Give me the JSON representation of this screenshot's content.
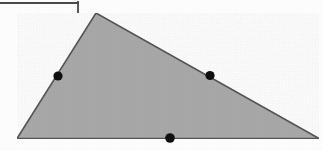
{
  "figure": {
    "caption": "",
    "type": "geometric-diagram",
    "shape_name": "triangle",
    "canvas": {
      "width": 323,
      "height": 150
    },
    "colors": {
      "background": "#fefefe",
      "triangle_fill": "#a8a8a8",
      "triangle_stroke": "#555555",
      "point_fill": "#101010",
      "artifact_stroke": "#4a4a4a"
    },
    "triangle": {
      "stroke_width": 1.6,
      "vertices": [
        {
          "name": "apex",
          "x": 96,
          "y": 13
        },
        {
          "name": "bottom-left",
          "x": 17,
          "y": 138.5
        },
        {
          "name": "bottom-right",
          "x": 319,
          "y": 138.5
        }
      ]
    },
    "points": [
      {
        "name": "midpoint-left-side",
        "x": 58,
        "y": 76,
        "radius": 4.6
      },
      {
        "name": "midpoint-hypotenuse",
        "x": 210,
        "y": 75.5,
        "radius": 4.6
      },
      {
        "name": "midpoint-base",
        "x": 170,
        "y": 138,
        "radius": 4.8
      }
    ],
    "artifact": {
      "name": "partial-rectangle-border",
      "description": "Cropped border fragment of an adjacent figure box at the top-left",
      "stroke_width": 1.8,
      "horizontal": {
        "x1": -2,
        "y1": 3,
        "x2": 78,
        "y2": 3
      },
      "vertical": {
        "x1": 78,
        "y1": 2,
        "x2": 78,
        "y2": 12
      }
    }
  }
}
